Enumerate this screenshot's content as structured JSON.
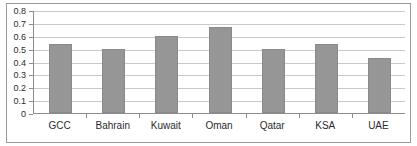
{
  "chart_data": {
    "type": "bar",
    "title": "",
    "subtitle": "",
    "xlabel": "",
    "ylabel": "",
    "categories": [
      "GCC",
      "Bahrain",
      "Kuwait",
      "Oman",
      "Qatar",
      "KSA",
      "UAE"
    ],
    "values": [
      0.535,
      0.5,
      0.595,
      0.67,
      0.5,
      0.535,
      0.425
    ],
    "series": [
      {
        "name": "Series 1",
        "values": [
          0.535,
          0.5,
          0.595,
          0.67,
          0.5,
          0.535,
          0.425
        ]
      }
    ],
    "ylim": [
      0,
      0.8
    ],
    "y_ticks": [
      0,
      0.1,
      0.2,
      0.3,
      0.4,
      0.5,
      0.6,
      0.7,
      0.8
    ],
    "y_tick_labels": [
      "0",
      "0.1",
      "0.2",
      "0.3",
      "0.4",
      "0.5",
      "0.6",
      "0.7",
      "0.8"
    ],
    "grid": true,
    "grid_axis": "y",
    "legend": false,
    "legend_position": "none",
    "bar_color": "#969696",
    "bar_border_color": "#8a8a8a",
    "gridline_color": "#c9c9c9",
    "axis_color": "#8c8c8c",
    "frame_color": "#9a9a9a",
    "background_color": "#ffffff",
    "annotations": []
  }
}
